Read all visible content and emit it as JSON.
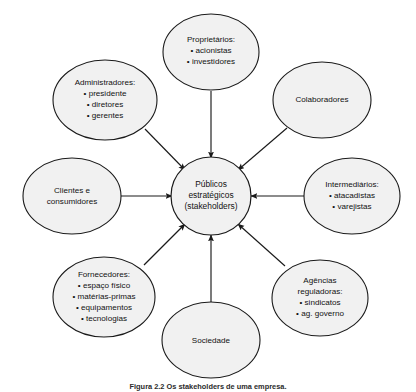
{
  "figure": {
    "caption_top": "",
    "caption_bottom": "Figura 2.2  Os stakeholders de uma empresa.",
    "background_color": "#ffffff",
    "node_fill_color": "#f1f1f1",
    "node_stroke_color": "#1a1a1a",
    "text_color": "#111111"
  },
  "center_node": {
    "name": "publicos-estrategicos",
    "lines": [
      "Públicos",
      "estratégicos",
      "(stakeholders)"
    ],
    "italic_line_index": 2
  },
  "nodes": [
    {
      "id": "proprietarios",
      "title": "Proprietários:",
      "items": [
        "acionistas",
        "investidores"
      ],
      "lines": [
        "Proprietários:",
        "• acionistas",
        "• investidores"
      ]
    },
    {
      "id": "administradores",
      "title": "Administradores:",
      "items": [
        "presidente",
        "diretores",
        "gerentes"
      ],
      "lines": [
        "Administradores:",
        "• presidente",
        "• diretores",
        "• gerentes"
      ]
    },
    {
      "id": "colaboradores",
      "title": "Colaboradores",
      "items": [],
      "lines": [
        "Colaboradores"
      ]
    },
    {
      "id": "clientes-e-consumidores",
      "title": "Clientes e consumidores",
      "items": [],
      "lines": [
        "Clientes e",
        "consumidores"
      ]
    },
    {
      "id": "intermediarios",
      "title": "Intermediários:",
      "items": [
        "atacadistas",
        "varejistas"
      ],
      "lines": [
        "Intermediários:",
        "• atacadistas",
        "• varejistas"
      ]
    },
    {
      "id": "fornecedores",
      "title": "Fornecedores:",
      "items": [
        "espaço físico",
        "matérias-primas",
        "equipamentos",
        "tecnologias"
      ],
      "lines": [
        "Fornecedores:",
        "• espaço físico",
        "• matérias-primas",
        "• equipamentos",
        "• tecnologias"
      ]
    },
    {
      "id": "sociedade",
      "title": "Sociedade",
      "items": [],
      "lines": [
        "Sociedade"
      ]
    },
    {
      "id": "agencias-reguladoras",
      "title": "Agências reguladoras:",
      "items": [
        "sindicatos",
        "ag. governo"
      ],
      "lines": [
        "Agências",
        "reguladoras:",
        "• sindicatos",
        "• ag. governo"
      ]
    }
  ],
  "connections": [
    {
      "from": "proprietarios",
      "to": "publicos-estrategicos",
      "direction": "in"
    },
    {
      "from": "administradores",
      "to": "publicos-estrategicos",
      "direction": "in"
    },
    {
      "from": "colaboradores",
      "to": "publicos-estrategicos",
      "direction": "in"
    },
    {
      "from": "clientes-e-consumidores",
      "to": "publicos-estrategicos",
      "direction": "in"
    },
    {
      "from": "intermediarios",
      "to": "publicos-estrategicos",
      "direction": "in"
    },
    {
      "from": "fornecedores",
      "to": "publicos-estrategicos",
      "direction": "in"
    },
    {
      "from": "sociedade",
      "to": "publicos-estrategicos",
      "direction": "in"
    },
    {
      "from": "agencias-reguladoras",
      "to": "publicos-estrategicos",
      "direction": "in"
    }
  ]
}
